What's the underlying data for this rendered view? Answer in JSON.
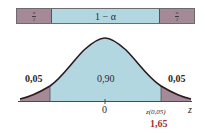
{
  "colors": {
    "tail": "#a48a96",
    "center": "#b3d7e1",
    "curve": "#2a1a1e",
    "axis": "#4a4a4a",
    "critical_value": "#a03030"
  },
  "top_bar": {
    "left_tail": {
      "numerator": "α",
      "denominator": "2"
    },
    "center_label": "1 − α",
    "right_tail": {
      "numerator": "α",
      "denominator": "2"
    }
  },
  "curve": {
    "left_tail_area": "0,05",
    "center_area": "0,90",
    "right_tail_area": "0,05",
    "axis_zero": "0",
    "critical_label": "z(0,05)",
    "axis_variable": "z",
    "critical_value": "1,65"
  }
}
